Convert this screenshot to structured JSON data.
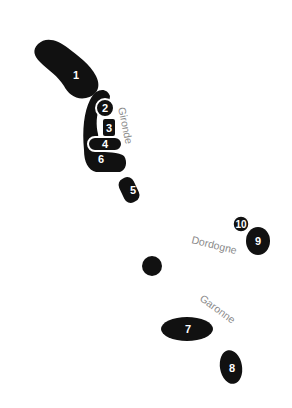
{
  "map": {
    "colors": {
      "region_fill": "#111111",
      "region_stroke": "#ffffff",
      "label_text": "#ffffff",
      "river_text": "#8a8a8a",
      "background": "#ffffff"
    },
    "regions": [
      {
        "id": 1,
        "label": "1"
      },
      {
        "id": 2,
        "label": "2"
      },
      {
        "id": 3,
        "label": "3"
      },
      {
        "id": 4,
        "label": "4"
      },
      {
        "id": 5,
        "label": "5"
      },
      {
        "id": 6,
        "label": "6"
      },
      {
        "id": 7,
        "label": "7"
      },
      {
        "id": 8,
        "label": "8"
      },
      {
        "id": 9,
        "label": "9"
      },
      {
        "id": 10,
        "label": "10"
      }
    ],
    "rivers": [
      {
        "name": "Gironde"
      },
      {
        "name": "Dordogne"
      },
      {
        "name": "Garonne"
      }
    ],
    "city_marker": {
      "label": ""
    }
  }
}
